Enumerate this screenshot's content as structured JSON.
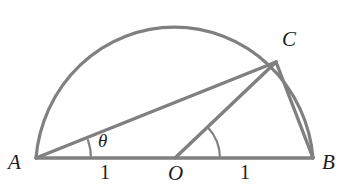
{
  "figure": {
    "type": "geometry-diagram",
    "background_color": "#ffffff",
    "stroke_color": "#808080",
    "label_color": "#1c1c1c"
  },
  "labels": {
    "vertex_a": "A",
    "vertex_b": "B",
    "vertex_c": "C",
    "center_o": "O",
    "angle_theta": "θ",
    "segment_ao_length": "1",
    "segment_ob_length": "1"
  },
  "geometry": {
    "points": {
      "A": {
        "x": 36,
        "y": 158
      },
      "O": {
        "x": 175,
        "y": 158
      },
      "B": {
        "x": 313,
        "y": 158
      },
      "C": {
        "x": 276,
        "y": 62
      }
    },
    "radius": 139,
    "semicircle": {
      "center_x": 175,
      "center_y": 158,
      "radius_x": 139,
      "radius_y": 143,
      "start_angle_deg": 180,
      "end_angle_deg": 0
    },
    "segments": [
      {
        "name": "diameter-AB",
        "from": "A",
        "to": "B"
      },
      {
        "name": "chord-AC",
        "from": "A",
        "to": "C"
      },
      {
        "name": "radius-OC",
        "from": "O",
        "to": "C"
      },
      {
        "name": "chord-CB",
        "from": "C",
        "to": "B"
      }
    ],
    "angle_arcs": [
      {
        "name": "angle-at-A",
        "vertex": "A",
        "radius": 55,
        "degrees": 19.0,
        "label": "θ"
      },
      {
        "name": "angle-at-O",
        "vertex": "O",
        "radius": 45,
        "degrees": 34.8,
        "label": ""
      }
    ]
  }
}
